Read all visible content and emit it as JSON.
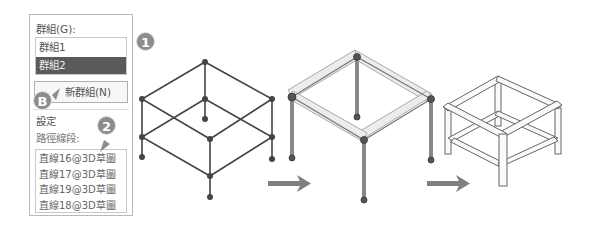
{
  "panel": {
    "group_label": "群組(G):",
    "groups": [
      {
        "label": "群組1",
        "selected": false
      },
      {
        "label": "群組2",
        "selected": true
      }
    ],
    "new_group_button": "新群組(N)",
    "settings_title": "設定",
    "path_segments_label": "路徑線段:",
    "path_segments": [
      "直線16@3D草圖",
      "直線17@3D草圖",
      "直線19@3D草圖",
      "直線18@3D草圖"
    ]
  },
  "callouts": {
    "one": "1",
    "b": "B",
    "two": "2"
  },
  "diagram": {
    "steps": [
      "3D sketch wireframe",
      "structure members applied",
      "finished frame"
    ],
    "arrow_color": "#808080",
    "line_color": "#444444"
  }
}
